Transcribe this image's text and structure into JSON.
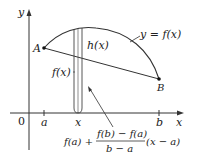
{
  "figure": {
    "type": "mean-value-theorem-diagram",
    "colors": {
      "background": "#ffffff",
      "line": "#333333",
      "text": "#222222",
      "strip": "#444444"
    },
    "axes": {
      "x_label": "x",
      "y_label": "y",
      "origin_label": "0",
      "x_ticks": [
        "a",
        "x",
        "b"
      ]
    },
    "points": {
      "A": "A",
      "B": "B"
    },
    "labels": {
      "curve": "y = f(x)",
      "h": "h(x)",
      "fx": "f(x)",
      "formula_left": "f(a) +",
      "formula_num": "f(b) − f(a)",
      "formula_den": "b − a",
      "formula_right": "(x − a)"
    }
  }
}
